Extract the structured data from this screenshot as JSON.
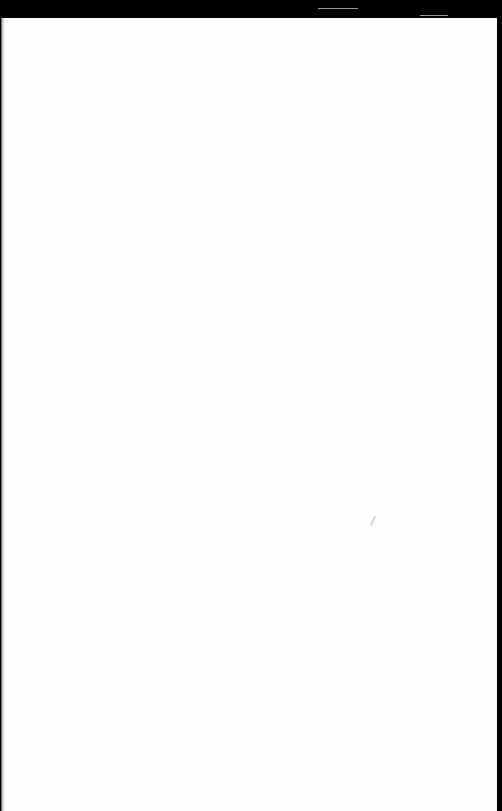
{
  "document": {
    "type": "scanned blank page",
    "page_color": "#fdfdfd",
    "background_color": "#000000",
    "bleed_through_left": "",
    "bleed_through_right": "",
    "visible_text": ""
  }
}
